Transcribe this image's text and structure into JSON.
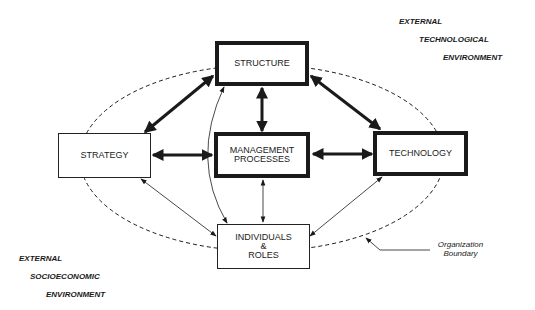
{
  "diagram": {
    "nodes": {
      "structure": "STRUCTURE",
      "strategy": "STRATEGY",
      "management_line1": "MANAGEMENT",
      "management_line2": "PROCESSES",
      "technology": "TECHNOLOGY",
      "individuals_line1": "INDIVIDUALS",
      "individuals_line2": "&",
      "individuals_line3": "ROLES"
    },
    "external_technological": [
      "EXTERNAL",
      "TECHNOLOGICAL",
      "ENVIRONMENT"
    ],
    "external_socioeconomic": [
      "EXTERNAL",
      "SOCIOECONOMIC",
      "ENVIRONMENT"
    ],
    "boundary_label": [
      "Organization",
      "Boundary"
    ]
  }
}
